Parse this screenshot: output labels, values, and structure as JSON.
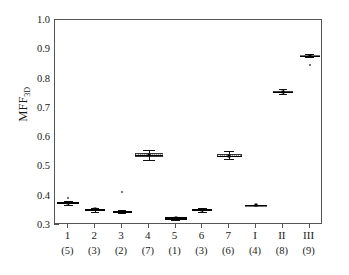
{
  "chart_data": {
    "type": "box",
    "title": "",
    "xlabel": "",
    "ylabel": "MFF",
    "ylabel_sub": "3D",
    "ylim": [
      0.3,
      1.0
    ],
    "ytick_values": [
      1.0,
      0.9,
      0.8,
      0.7,
      0.6,
      0.5,
      0.4,
      0.3
    ],
    "ytick_labels": [
      "1.0",
      "0.9",
      "0.8",
      "0.7",
      "0.6",
      "0.5",
      "0.4",
      "0.3"
    ],
    "ytick_minor_values": [
      0.95,
      0.85,
      0.75,
      0.65,
      0.55,
      0.45,
      0.35
    ],
    "grid": false,
    "legend": "none",
    "categories": [
      "1",
      "2",
      "3",
      "4",
      "5",
      "6",
      "7",
      "I",
      "II",
      "III"
    ],
    "sample_counts": [
      "(5)",
      "(3)",
      "(2)",
      "(7)",
      "(1)",
      "(3)",
      "(6)",
      "(4)",
      "(8)",
      "(9)"
    ],
    "boxes": [
      {
        "name": "1",
        "count": "(5)",
        "whisker_low": 0.368,
        "q1": 0.371,
        "median": 0.375,
        "q3": 0.379,
        "whisker_high": 0.382,
        "mean": 0.375,
        "style": "dark",
        "width": 22,
        "outliers": [
          0.392
        ]
      },
      {
        "name": "2",
        "count": "(3)",
        "whisker_low": 0.346,
        "q1": 0.35,
        "median": 0.353,
        "q3": 0.356,
        "whisker_high": 0.359,
        "mean": 0.353,
        "style": "dark",
        "width": 20,
        "outliers": []
      },
      {
        "name": "3",
        "count": "(2)",
        "whisker_low": 0.34,
        "q1": 0.343,
        "median": 0.345,
        "q3": 0.348,
        "whisker_high": 0.351,
        "mean": 0.345,
        "style": "dark",
        "width": 19,
        "outliers": [
          0.411
        ]
      },
      {
        "name": "4",
        "count": "(7)",
        "whisker_low": 0.521,
        "q1": 0.533,
        "median": 0.539,
        "q3": 0.545,
        "whisker_high": 0.557,
        "mean": 0.539,
        "style": "light",
        "width": 28,
        "outliers": []
      },
      {
        "name": "5",
        "count": "(1)",
        "whisker_low": 0.318,
        "q1": 0.321,
        "median": 0.323,
        "q3": 0.326,
        "whisker_high": 0.329,
        "mean": 0.323,
        "style": "dark",
        "width": 22,
        "outliers": []
      },
      {
        "name": "6",
        "count": "(3)",
        "whisker_low": 0.345,
        "q1": 0.349,
        "median": 0.352,
        "q3": 0.355,
        "whisker_high": 0.359,
        "mean": 0.352,
        "style": "dark",
        "width": 20,
        "outliers": []
      },
      {
        "name": "7",
        "count": "(6)",
        "whisker_low": 0.526,
        "q1": 0.532,
        "median": 0.537,
        "q3": 0.542,
        "whisker_high": 0.551,
        "mean": 0.537,
        "style": "light",
        "width": 25,
        "outliers": []
      },
      {
        "name": "I",
        "count": "(4)",
        "whisker_low": 0.366,
        "q1": 0.367,
        "median": 0.368,
        "q3": 0.369,
        "whisker_high": 0.37,
        "mean": 0.368,
        "style": "mid",
        "width": 22,
        "outliers": []
      },
      {
        "name": "II",
        "count": "(8)",
        "whisker_low": 0.748,
        "q1": 0.752,
        "median": 0.755,
        "q3": 0.758,
        "whisker_high": 0.763,
        "mean": 0.755,
        "style": "light",
        "width": 20,
        "outliers": []
      },
      {
        "name": "III",
        "count": "(9)",
        "whisker_low": 0.872,
        "q1": 0.876,
        "median": 0.878,
        "q3": 0.881,
        "whisker_high": 0.885,
        "mean": 0.878,
        "style": "mid",
        "width": 20,
        "outliers": [
          0.845
        ]
      }
    ]
  }
}
